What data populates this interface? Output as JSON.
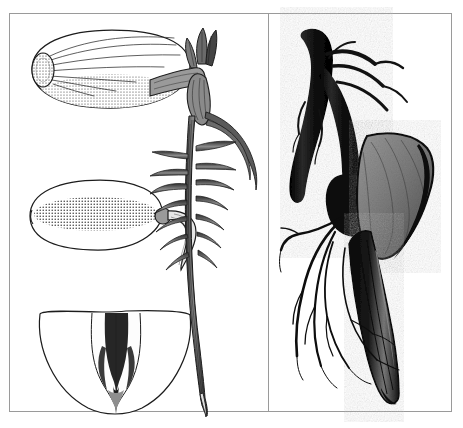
{
  "plate": {
    "title": "Botanical plate: seed and root structures",
    "background_color": "#ffffff",
    "frame_color": "#9a9a9a",
    "ink_color": "#1c1c1c",
    "mid_tone_color": "#808080",
    "light_tone_color": "#c8c8c8",
    "panel_count": 2,
    "layout": "two vertical panels separated by a thin rule",
    "caption_text": "",
    "label_text": ""
  },
  "panels": [
    {
      "id": "left",
      "name": "line-engraving-panel",
      "technique": "pen-and-ink line engraving with stipple shading",
      "figure_count": 4,
      "figures": [
        {
          "id": "fig-seed-whole",
          "name": "whole-seed-lateral-view",
          "description": "Large ovate seed seen from the side, flattened ellipse, stippled shading along the lower margin, dark oval hilum at the left end with fine radiating lines running across the testa",
          "shape": "ellipse",
          "position": {
            "x": 22,
            "y": 20,
            "w": 152,
            "h": 76
          },
          "shading": "stipple",
          "parts": [
            "testa",
            "hilum",
            "raphe lines"
          ]
        },
        {
          "id": "fig-seed-germinating",
          "name": "germinating-seed-with-radicle",
          "description": "Ovate seed in outline with a dense horizontal cross-hatched band through its middle; a thick curved radicle emerges at the right and hooks downward to a pointed tip",
          "shape": "ellipse-with-projection",
          "position": {
            "x": 22,
            "y": 168,
            "w": 150,
            "h": 80
          },
          "shading": "cross-hatch band",
          "parts": [
            "testa",
            "micropyle",
            "radicle"
          ]
        },
        {
          "id": "fig-seed-section",
          "name": "seed-longitudinal-section",
          "description": "Half-ellipse with a flat cut top and rounded base; in the centre a narrow V-shaped dark embryo with plumule and radicle set in a pale cavity",
          "shape": "half-ellipse",
          "position": {
            "x": 28,
            "y": 296,
            "w": 148,
            "h": 110
          },
          "shading": "solid dark embryo in outline shell",
          "parts": [
            "cotyledon",
            "embryo",
            "plumule",
            "radicle"
          ]
        },
        {
          "id": "fig-seedling",
          "name": "seedling-with-taproot",
          "description": "Erect seedling: pointed plumule bud with two leaf scales at the top, a short thick hypocotyl, then a long tapering taproot bearing roughly fourteen lateral roots spreading left and right, reaching almost to the foot of the panel",
          "position": {
            "x": 160,
            "y": 18,
            "w": 95,
            "h": 384
          },
          "lateral_root_count": 14,
          "parts": [
            "plumule",
            "leaf scales",
            "hypocotyl",
            "taproot",
            "lateral roots",
            "root tip"
          ]
        }
      ]
    },
    {
      "id": "right",
      "name": "halftone-photograph-panel",
      "technique": "dark halftone photographic reproduction",
      "figure_count": 1,
      "figures": [
        {
          "id": "fig-root-specimen",
          "name": "mature-root-specimen",
          "description": "Photograph of a stout dark rhizome or taproot curving from upper left, swelling at a node, with a broad grey wedge-shaped blade attached on the right side and a long tapering dark root descending to the base of the panel; a spray of fine fibrous roots hangs to the left",
          "position": {
            "x": 285,
            "y": 20,
            "w": 155,
            "h": 390
          },
          "tone": "dark with mid-grey blade",
          "parts": [
            "rhizome",
            "node",
            "blade",
            "fibrous roots",
            "tapering root"
          ]
        }
      ]
    }
  ]
}
